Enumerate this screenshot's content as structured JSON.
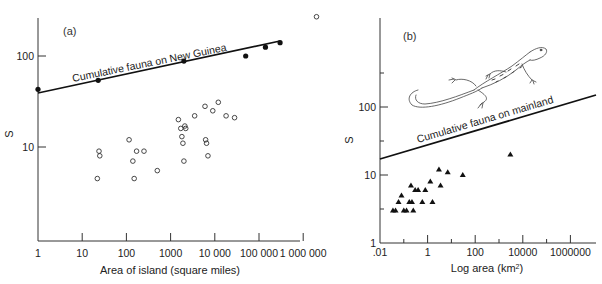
{
  "chart_data": [
    {
      "type": "scatter",
      "panel": "(a)",
      "title": "",
      "xlabel": "Area of island (square miles)",
      "ylabel": "S",
      "xscale": "log",
      "yscale": "log",
      "xlim": [
        1,
        2000000
      ],
      "ylim": [
        1,
        400
      ],
      "x_ticks": [
        "1",
        "10",
        "100",
        "1000",
        "10 000",
        "100 000",
        "1 000 000"
      ],
      "y_ticks": [
        "10",
        "100"
      ],
      "grid": false,
      "line_label": "Cumulative fauna on New Guinea",
      "series": [
        {
          "name": "Cumulative fauna on New Guinea",
          "marker": "filled-circle",
          "line": {
            "x": [
              1,
              300000
            ],
            "y": [
              37,
              140
            ]
          },
          "points": [
            {
              "x": 1,
              "y": 43
            },
            {
              "x": 23,
              "y": 54
            },
            {
              "x": 2000,
              "y": 88
            },
            {
              "x": 50000,
              "y": 100
            },
            {
              "x": 140000,
              "y": 125
            },
            {
              "x": 300000,
              "y": 140
            }
          ]
        },
        {
          "name": "Islands",
          "marker": "open-circle",
          "points": [
            {
              "x": 22,
              "y": 4.5
            },
            {
              "x": 24,
              "y": 9
            },
            {
              "x": 25,
              "y": 8
            },
            {
              "x": 115,
              "y": 12
            },
            {
              "x": 140,
              "y": 7
            },
            {
              "x": 150,
              "y": 4.5
            },
            {
              "x": 170,
              "y": 9
            },
            {
              "x": 250,
              "y": 9
            },
            {
              "x": 500,
              "y": 5.5
            },
            {
              "x": 1500,
              "y": 20
            },
            {
              "x": 1700,
              "y": 16
            },
            {
              "x": 1800,
              "y": 13
            },
            {
              "x": 2100,
              "y": 17
            },
            {
              "x": 2200,
              "y": 16
            },
            {
              "x": 2000,
              "y": 7
            },
            {
              "x": 1900,
              "y": 11
            },
            {
              "x": 3500,
              "y": 22
            },
            {
              "x": 6000,
              "y": 28
            },
            {
              "x": 6200,
              "y": 12
            },
            {
              "x": 6500,
              "y": 11
            },
            {
              "x": 7000,
              "y": 8
            },
            {
              "x": 9000,
              "y": 25
            },
            {
              "x": 12000,
              "y": 31
            },
            {
              "x": 18000,
              "y": 22
            },
            {
              "x": 28000,
              "y": 21
            },
            {
              "x": 2000000,
              "y": 270
            }
          ]
        }
      ]
    },
    {
      "type": "scatter",
      "panel": "(b)",
      "title": "",
      "xlabel": "Log area (km²)",
      "ylabel": "S",
      "xscale": "log",
      "yscale": "log",
      "xlim": [
        0.01,
        10000000
      ],
      "ylim": [
        1,
        1000
      ],
      "x_ticks": [
        ".01",
        "1",
        "100",
        "10000",
        "1000000"
      ],
      "y_ticks": [
        "1",
        "10",
        "100"
      ],
      "grid": false,
      "line_label": "Cumulative fauna on mainland",
      "annotation": "lizard illustration",
      "series": [
        {
          "name": "Cumulative fauna on mainland",
          "marker": "none",
          "line": {
            "x": [
              0.01,
              10000000
            ],
            "y": [
              17,
              160
            ]
          }
        },
        {
          "name": "Islands",
          "marker": "filled-triangle",
          "points": [
            {
              "x": 0.035,
              "y": 3
            },
            {
              "x": 0.045,
              "y": 3
            },
            {
              "x": 0.06,
              "y": 4
            },
            {
              "x": 0.08,
              "y": 5
            },
            {
              "x": 0.1,
              "y": 3
            },
            {
              "x": 0.13,
              "y": 3
            },
            {
              "x": 0.17,
              "y": 4
            },
            {
              "x": 0.2,
              "y": 7
            },
            {
              "x": 0.22,
              "y": 4
            },
            {
              "x": 0.25,
              "y": 3
            },
            {
              "x": 0.3,
              "y": 6
            },
            {
              "x": 0.4,
              "y": 6
            },
            {
              "x": 0.6,
              "y": 4
            },
            {
              "x": 0.8,
              "y": 6
            },
            {
              "x": 1.3,
              "y": 8
            },
            {
              "x": 1.6,
              "y": 4
            },
            {
              "x": 3,
              "y": 12
            },
            {
              "x": 3.5,
              "y": 7
            },
            {
              "x": 7,
              "y": 11
            },
            {
              "x": 30,
              "y": 10
            },
            {
              "x": 3000,
              "y": 20
            }
          ]
        }
      ]
    }
  ],
  "panels": {
    "a": {
      "label": "(a)",
      "ylabel": "S",
      "xlabel": "Area of island (square miles)",
      "line_label": "Cumulative fauna on New Guinea",
      "x_ticks": [
        "1",
        "10",
        "100",
        "1000",
        "10 000",
        "100 000",
        "1 000 000"
      ],
      "y_ticks": [
        "10",
        "100"
      ]
    },
    "b": {
      "label": "(b)",
      "ylabel": "S",
      "xlabel": "Log area (km",
      "xlabel_sup": "2",
      "xlabel_end": ")",
      "line_label": "Cumulative fauna on mainland",
      "x_ticks": [
        ".01",
        "1",
        "100",
        "10000",
        "1000000"
      ],
      "y_ticks": [
        "1",
        "10",
        "100"
      ]
    }
  }
}
